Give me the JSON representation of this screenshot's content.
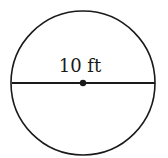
{
  "diagram": {
    "shape": "circle",
    "label": "10 ft",
    "measurement": "diameter",
    "value": 10,
    "unit": "ft",
    "colors": {
      "stroke": "#1a1a1a",
      "background": "#ffffff"
    }
  }
}
